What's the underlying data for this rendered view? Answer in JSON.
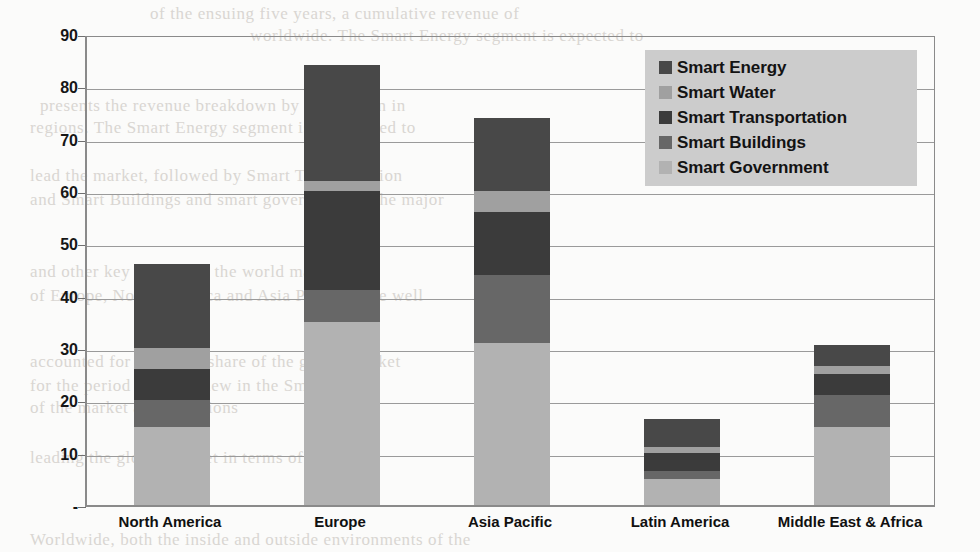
{
  "chart_data": {
    "type": "bar",
    "subtype": "stacked-bar",
    "title": "",
    "xlabel": "",
    "ylabel": "",
    "ylim": [
      0,
      90
    ],
    "ytick_values": [
      0,
      10,
      20,
      30,
      40,
      50,
      60,
      70,
      80,
      90
    ],
    "ytick_labels": [
      "-",
      "10",
      "20",
      "30",
      "40",
      "50",
      "60",
      "70",
      "80",
      "90"
    ],
    "grid": true,
    "legend_position": "top-right",
    "categories": [
      "North America",
      "Europe",
      "Asia Pacific",
      "Latin America",
      "Middle East & Africa"
    ],
    "series": [
      {
        "name": "Smart Government",
        "color": "#b2b2b2",
        "values": [
          15,
          35,
          31,
          5,
          15
        ]
      },
      {
        "name": "Smart Buildings",
        "color": "#676767",
        "values": [
          5,
          6,
          13,
          1.5,
          6
        ]
      },
      {
        "name": "Smart Transportation",
        "color": "#3b3b3b",
        "values": [
          6,
          19,
          12,
          3.5,
          4
        ]
      },
      {
        "name": "Smart Water",
        "color": "#a0a0a0",
        "values": [
          4,
          2,
          4,
          1,
          1.5
        ]
      },
      {
        "name": "Smart Energy",
        "color": "#484848",
        "values": [
          16,
          22,
          14,
          5.5,
          4
        ]
      }
    ],
    "totals": [
      46,
      84,
      74,
      16.5,
      30.5
    ]
  },
  "legend": {
    "items": [
      {
        "label": "Smart Energy",
        "color": "#484848"
      },
      {
        "label": "Smart Water",
        "color": "#a0a0a0"
      },
      {
        "label": "Smart Transportation",
        "color": "#3b3b3b"
      },
      {
        "label": "Smart Buildings",
        "color": "#676767"
      },
      {
        "label": "Smart Government",
        "color": "#b2b2b2"
      }
    ],
    "background_color": "#cccccc"
  },
  "axis_style": {
    "line_color": "#8a8a8a",
    "grid_color": "#9a9a9a",
    "text_color": "#161616"
  },
  "background": {
    "page_color": "#fbfbfa",
    "bleed_lines": [
      {
        "text": "of the ensuing five years, a cumulative revenue of",
        "x": 150,
        "y": 4
      },
      {
        "text": "worldwide. The Smart Energy segment is expected to",
        "x": 250,
        "y": 26
      },
      {
        "text": "presents the revenue breakdown by application in",
        "x": 40,
        "y": 96
      },
      {
        "text": "regions. The Smart Energy segment is anticipated to",
        "x": 30,
        "y": 118
      },
      {
        "text": "lead the market, followed by Smart Transportation",
        "x": 30,
        "y": 166
      },
      {
        "text": "and Smart Buildings and smart government in the major",
        "x": 30,
        "y": 190
      },
      {
        "text": "and other key regions of the world market",
        "x": 30,
        "y": 262
      },
      {
        "text": "of Europe, North America and Asia Pacific were well",
        "x": 30,
        "y": 286
      },
      {
        "text": "accounted for a notable share of the global market",
        "x": 30,
        "y": 352
      },
      {
        "text": "for the period under review in the Smart Grid",
        "x": 30,
        "y": 376
      },
      {
        "text": "of the market across regions",
        "x": 30,
        "y": 398
      },
      {
        "text": "leading the global market in terms of revenue",
        "x": 30,
        "y": 448
      },
      {
        "text": "Worldwide, both the inside and outside environments of the",
        "x": 30,
        "y": 530
      }
    ]
  }
}
